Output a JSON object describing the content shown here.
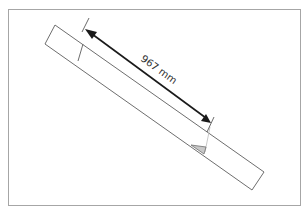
{
  "diagram": {
    "type": "dimensioned-beam",
    "dimension_label": "967 mm",
    "colors": {
      "frame": "#a6a6a6",
      "beam_outline": "#6e6e6e",
      "dimension_arrow": "#1a1a1a",
      "angle_marker": "#c8c8c8"
    }
  }
}
